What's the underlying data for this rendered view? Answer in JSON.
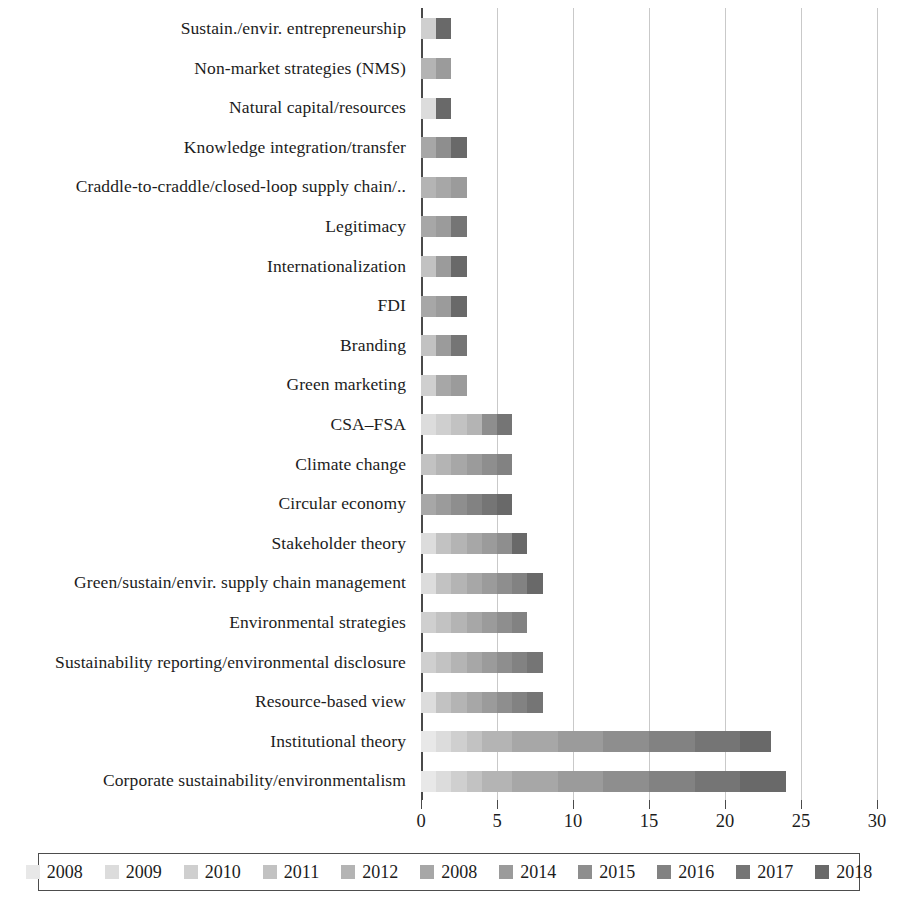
{
  "chart_data": {
    "type": "bar",
    "orientation": "horizontal",
    "stacked": true,
    "title": "",
    "subtitle": "",
    "xlabel": "",
    "ylabel": "",
    "xlim": [
      0,
      30
    ],
    "xticks": [
      0,
      5,
      10,
      15,
      20,
      25,
      30
    ],
    "xtick_labels": [
      "0",
      "5",
      "10",
      "15",
      "20",
      "25",
      "30"
    ],
    "grid": true,
    "grid_axis": "x",
    "legend_position": "bottom",
    "legend_entries": [
      "2008",
      "2009",
      "2010",
      "2011",
      "2012",
      "2008",
      "2014",
      "2015",
      "2016",
      "2017",
      "2018"
    ],
    "series_colors": [
      "#e8e8e8",
      "#dcdcdc",
      "#cfcfcf",
      "#c2c2c2",
      "#b4b4b4",
      "#a7a7a7",
      "#9b9b9b",
      "#8e8e8e",
      "#828282",
      "#757575",
      "#696969"
    ],
    "categories": [
      "Sustain./envir. entrepreneurship",
      "Non-market strategies (NMS)",
      "Natural capital/resources",
      "Knowledge integration/transfer",
      "Craddle-to-craddle/closed-loop supply chain/..",
      "Legitimacy",
      "Internationalization",
      "FDI",
      "Branding",
      "Green marketing",
      "CSA–FSA",
      "Climate change",
      "Circular economy",
      "Stakeholder theory",
      "Green/sustain/envir. supply chain management",
      "Environmental strategies",
      "Sustainability reporting/environmental disclosure",
      "Resource-based view",
      "Institutional theory",
      "Corporate sustainability/environmentalism"
    ],
    "series": [
      {
        "name": "2008",
        "values": [
          0,
          0,
          0,
          0,
          0,
          0,
          0,
          0,
          0,
          0,
          0,
          0,
          0,
          0,
          0,
          0,
          0,
          0,
          1,
          1
        ]
      },
      {
        "name": "2009",
        "values": [
          0,
          0,
          1,
          0,
          0,
          0,
          0,
          0,
          0,
          0,
          1,
          0,
          0,
          1,
          1,
          0,
          0,
          1,
          1,
          1
        ]
      },
      {
        "name": "2010",
        "values": [
          1,
          0,
          0,
          0,
          0,
          0,
          0,
          0,
          0,
          1,
          1,
          0,
          0,
          0,
          0,
          1,
          1,
          0,
          1,
          1
        ]
      },
      {
        "name": "2011",
        "values": [
          0,
          0,
          0,
          0,
          0,
          0,
          1,
          0,
          1,
          0,
          1,
          1,
          0,
          1,
          1,
          1,
          1,
          1,
          1,
          1
        ]
      },
      {
        "name": "2012",
        "values": [
          0,
          1,
          0,
          0,
          1,
          0,
          0,
          0,
          0,
          0,
          1,
          1,
          0,
          1,
          1,
          1,
          1,
          1,
          2,
          2
        ]
      },
      {
        "name": "2008",
        "values": [
          0,
          0,
          0,
          1,
          1,
          1,
          0,
          1,
          0,
          1,
          0,
          1,
          1,
          1,
          1,
          1,
          1,
          1,
          3,
          3
        ]
      },
      {
        "name": "2014",
        "values": [
          0,
          1,
          0,
          0,
          1,
          1,
          1,
          1,
          1,
          1,
          0,
          1,
          1,
          1,
          1,
          1,
          1,
          1,
          3,
          3
        ]
      },
      {
        "name": "2015",
        "values": [
          0,
          0,
          0,
          1,
          0,
          0,
          0,
          0,
          0,
          0,
          1,
          1,
          1,
          1,
          1,
          1,
          1,
          1,
          3,
          3
        ]
      },
      {
        "name": "2016",
        "values": [
          0,
          0,
          0,
          0,
          0,
          0,
          0,
          0,
          0,
          0,
          0,
          1,
          1,
          0,
          1,
          1,
          1,
          1,
          3,
          3
        ]
      },
      {
        "name": "2017",
        "values": [
          0,
          0,
          0,
          0,
          0,
          1,
          0,
          0,
          1,
          0,
          1,
          0,
          1,
          0,
          0,
          0,
          1,
          1,
          3,
          3
        ]
      },
      {
        "name": "2018",
        "values": [
          1,
          0,
          1,
          1,
          0,
          0,
          1,
          1,
          0,
          0,
          0,
          0,
          1,
          1,
          1,
          0,
          0,
          0,
          2,
          3
        ]
      }
    ],
    "totals": [
      2,
      2,
      2,
      2,
      3,
      3,
      3,
      3,
      3,
      4,
      6,
      6,
      6,
      7,
      8,
      8,
      9,
      9,
      23,
      24
    ]
  }
}
